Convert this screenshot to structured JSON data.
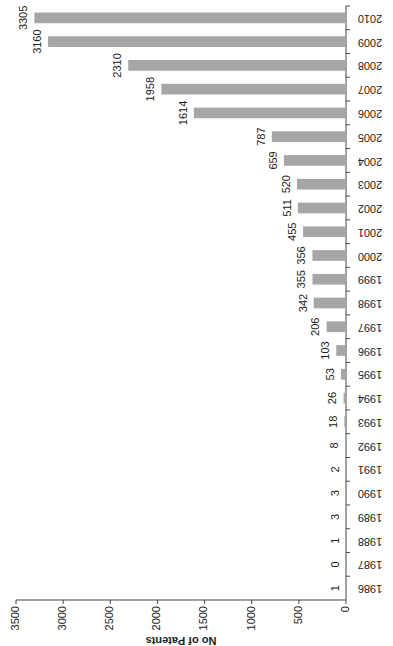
{
  "chart_data": {
    "type": "bar",
    "orientation": "rotated-90-clockwise",
    "title": "",
    "xlabel": "",
    "ylabel": "No of Patents",
    "ylim": [
      0,
      3500
    ],
    "yticks": [
      0,
      500,
      1000,
      1500,
      2000,
      2500,
      3000,
      3500
    ],
    "grid": false,
    "legend": null,
    "bar_color": "#a6a6a6",
    "categories": [
      "1986",
      "1987",
      "1988",
      "1989",
      "1990",
      "1991",
      "1992",
      "1993",
      "1994",
      "1995",
      "1996",
      "1997",
      "1998",
      "1999",
      "2000",
      "2001",
      "2002",
      "2003",
      "2004",
      "2005",
      "2006",
      "2007",
      "2008",
      "2009",
      "2010"
    ],
    "values": [
      1,
      0,
      1,
      3,
      3,
      2,
      8,
      18,
      26,
      53,
      103,
      206,
      342,
      355,
      356,
      455,
      511,
      520,
      659,
      787,
      1614,
      1958,
      2310,
      3160,
      3305
    ],
    "data_labels": true
  }
}
